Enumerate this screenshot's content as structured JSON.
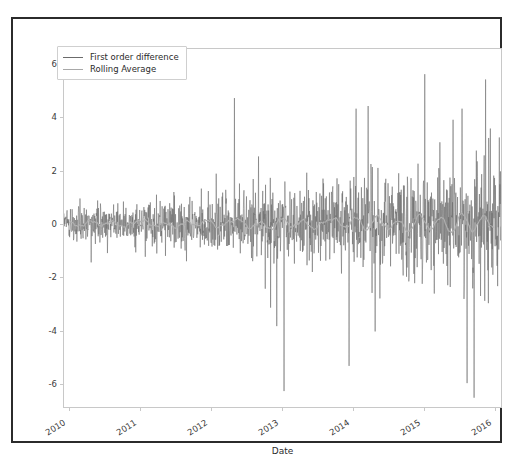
{
  "figure": {
    "background": "#ffffff",
    "frame_color": "#2b2b2b",
    "axes_spine_color": "#c8c8c8"
  },
  "legend": {
    "entries": [
      {
        "label": "First order difference",
        "color": "#6b6b6b"
      },
      {
        "label": "Rolling Average",
        "color": "#a8a8a8"
      }
    ]
  },
  "chart_data": {
    "type": "line",
    "title": "",
    "subtitle": "",
    "xlabel": "Date",
    "ylabel": "",
    "grid": false,
    "legend_position": "upper left",
    "xlim": [
      2009.92,
      2016.1
    ],
    "ylim": [
      -6.9,
      6.6
    ],
    "yticks": [
      6,
      4,
      2,
      0,
      -2,
      -4,
      -6
    ],
    "ytick_labels": [
      "6",
      "4",
      "2",
      "0",
      "-2",
      "-4",
      "-6"
    ],
    "xticks": [
      2010,
      2011,
      2012,
      2013,
      2014,
      2015,
      2016
    ],
    "xtick_labels": [
      "2010",
      "2011",
      "2012",
      "2013",
      "2014",
      "2015",
      "2016"
    ],
    "series": [
      {
        "name": "First order difference",
        "color": "#6b6b6b",
        "linewidth": 0.55,
        "description": "Daily first-order differenced series, mean ~0, volatility increasing over time from about +/-0.8 in 2010 to about +/-3.5 in 2015-2016",
        "volatility_profile": {
          "x": [
            2010.0,
            2010.5,
            2011.0,
            2011.5,
            2012.0,
            2012.5,
            2013.0,
            2013.5,
            2014.0,
            2014.5,
            2015.0,
            2015.5,
            2016.0
          ],
          "sigma": [
            0.32,
            0.35,
            0.4,
            0.46,
            0.58,
            0.66,
            0.62,
            0.7,
            0.8,
            0.92,
            1.05,
            1.2,
            1.1
          ]
        },
        "notable_extremes": [
          {
            "x": 2012.33,
            "y": 4.75
          },
          {
            "x": 2013.03,
            "y": -6.3
          },
          {
            "x": 2012.93,
            "y": -3.85
          },
          {
            "x": 2014.05,
            "y": 4.35
          },
          {
            "x": 2014.22,
            "y": 4.45
          },
          {
            "x": 2013.95,
            "y": -5.35
          },
          {
            "x": 2014.32,
            "y": -4.05
          },
          {
            "x": 2015.02,
            "y": 5.65
          },
          {
            "x": 2015.55,
            "y": 4.35
          },
          {
            "x": 2015.62,
            "y": -6.0
          },
          {
            "x": 2015.72,
            "y": -6.55
          },
          {
            "x": 2015.88,
            "y": 5.45
          },
          {
            "x": 2015.95,
            "y": 3.6
          }
        ]
      },
      {
        "name": "Rolling Average",
        "color": "#b0b0b0",
        "linewidth": 1.1,
        "description": "Smoothed rolling mean oscillating tightly around 0, range approximately -0.45 to +0.45",
        "x": [
          2010.0,
          2010.15,
          2010.3,
          2010.45,
          2010.6,
          2010.75,
          2010.9,
          2011.05,
          2011.2,
          2011.35,
          2011.5,
          2011.65,
          2011.8,
          2011.95,
          2012.1,
          2012.25,
          2012.4,
          2012.55,
          2012.7,
          2012.85,
          2013.0,
          2013.15,
          2013.3,
          2013.45,
          2013.6,
          2013.75,
          2013.9,
          2014.05,
          2014.2,
          2014.35,
          2014.5,
          2014.65,
          2014.8,
          2014.95,
          2015.1,
          2015.25,
          2015.4,
          2015.55,
          2015.7,
          2015.85,
          2016.0
        ],
        "y": [
          0.05,
          -0.08,
          0.12,
          -0.05,
          0.09,
          -0.11,
          0.06,
          0.14,
          -0.09,
          0.04,
          -0.13,
          0.1,
          -0.06,
          0.16,
          -0.12,
          0.08,
          0.18,
          -0.15,
          0.07,
          -0.2,
          0.22,
          -0.1,
          0.13,
          -0.18,
          0.09,
          0.2,
          -0.14,
          0.26,
          -0.22,
          0.3,
          -0.17,
          0.12,
          -0.28,
          0.34,
          -0.2,
          0.25,
          -0.33,
          0.4,
          -0.26,
          0.3,
          -0.15
        ]
      }
    ]
  }
}
